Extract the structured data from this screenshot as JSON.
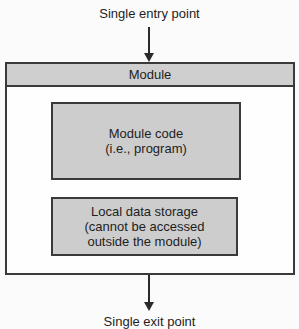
{
  "diagram": {
    "entry_label": "Single entry point",
    "module_title": "Module",
    "module_code": {
      "line1": "Module code",
      "line2": "(i.e., program)"
    },
    "local_data": {
      "line1": "Local data storage",
      "line2": "(cannot be accessed",
      "line3": "outside the module)"
    },
    "exit_label": "Single exit point"
  },
  "colors": {
    "header_fill": "#cfcfcf",
    "inner_fill": "#cdcdcd",
    "stroke": "#3a3a3a",
    "background": "#fbfbfb"
  }
}
